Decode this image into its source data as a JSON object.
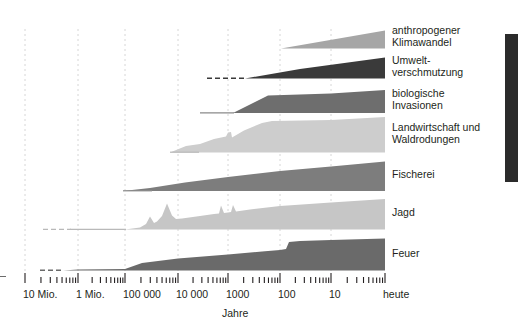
{
  "figure": {
    "axis_title": "Jahre",
    "axis_scale": "logarithmic-reversed",
    "left_edge_mark": "axis-start-mark"
  },
  "series_labels": [
    "anthropogener\nKlimawandel",
    "Umwelt-\nverschmutzung",
    "biologische\nInvasionen",
    "Landwirtschaft und\nWaldrodungen",
    "Fischerei",
    "Jagd",
    "Feuer"
  ],
  "axis": {
    "ticks": [
      "10 Mio.",
      "1 Mio.",
      "100 000",
      "10 000",
      "1000",
      "100",
      "10",
      "heute"
    ],
    "tick_x": [
      25,
      78,
      125,
      178,
      228,
      280,
      331,
      385
    ]
  },
  "colors": {
    "klimawandel": "#a6a6a6",
    "umweltverschmutzung": "#3a3a3a",
    "invasionen": "#6e6e6e",
    "landwirtschaft": "#cdcdcd",
    "fischerei": "#7d7d7d",
    "jagd": "#c6c6c6",
    "feuer": "#6a6a6a",
    "gridline": "#d6d6d6",
    "text": "#231f20",
    "right_bar": "#2b2b2b"
  },
  "chart_data": {
    "type": "area",
    "title": "",
    "xlabel": "Jahre",
    "ylabel": "",
    "grid": true,
    "legend_position": "right-inline",
    "x_axis": {
      "scale": "log-reversed",
      "tick_labels": [
        "10 Mio.",
        "1 Mio.",
        "100 000",
        "10 000",
        "1000",
        "100",
        "10",
        "heute"
      ],
      "tick_values": [
        10000000,
        1000000,
        100000,
        10000,
        1000,
        100,
        10,
        0
      ],
      "units": "Jahre vor heute"
    },
    "series": [
      {
        "name": "anthropogener Klimawandel",
        "color": "#a6a6a6",
        "starts_at_years_ago": 100,
        "dashed_prefix": false,
        "values": [
          {
            "x": 100,
            "intensity": 0
          },
          {
            "x": 10,
            "intensity": 0.55
          },
          {
            "x": 0,
            "intensity": 1.0
          }
        ]
      },
      {
        "name": "Umweltverschmutzung",
        "color": "#3a3a3a",
        "starts_at_years_ago": 2500,
        "dashed_prefix": true,
        "values": [
          {
            "x": 2500,
            "intensity": 0
          },
          {
            "x": 600,
            "intensity": 0.05
          },
          {
            "x": 100,
            "intensity": 0.5
          },
          {
            "x": 0,
            "intensity": 1.0
          }
        ]
      },
      {
        "name": "biologische Invasionen",
        "color": "#6e6e6e",
        "starts_at_years_ago": 3500,
        "dashed_prefix": false,
        "values": [
          {
            "x": 3500,
            "intensity": 0
          },
          {
            "x": 1000,
            "intensity": 0.05
          },
          {
            "x": 300,
            "intensity": 0.78
          },
          {
            "x": 100,
            "intensity": 0.85
          },
          {
            "x": 0,
            "intensity": 1.0
          }
        ]
      },
      {
        "name": "Landwirtschaft und Waldrodungen",
        "color": "#cdcdcd",
        "starts_at_years_ago": 12000,
        "dashed_prefix": false,
        "values": [
          {
            "x": 12000,
            "intensity": 0
          },
          {
            "x": 6000,
            "intensity": 0.22
          },
          {
            "x": 3000,
            "intensity": 0.42
          },
          {
            "x": 1800,
            "intensity": 0.52
          },
          {
            "x": 1500,
            "intensity": 0.4
          },
          {
            "x": 600,
            "intensity": 0.9
          },
          {
            "x": 100,
            "intensity": 0.95
          },
          {
            "x": 0,
            "intensity": 1.0
          }
        ]
      },
      {
        "name": "Fischerei",
        "color": "#7d7d7d",
        "starts_at_years_ago": 1000000,
        "dashed_prefix": false,
        "values": [
          {
            "x": 1000000,
            "intensity": 0
          },
          {
            "x": 30000,
            "intensity": 0.12
          },
          {
            "x": 1000,
            "intensity": 0.45
          },
          {
            "x": 0,
            "intensity": 1.0
          }
        ]
      },
      {
        "name": "Jagd",
        "color": "#c6c6c6",
        "starts_at_years_ago": 20000000,
        "dashed_prefix": true,
        "values": [
          {
            "x": 20000000,
            "intensity": 0
          },
          {
            "x": 1000000,
            "intensity": 0
          },
          {
            "x": 60000,
            "intensity": 0.04
          },
          {
            "x": 40000,
            "intensity": 0.42
          },
          {
            "x": 30000,
            "intensity": 0.25
          },
          {
            "x": 14000,
            "intensity": 0.92
          },
          {
            "x": 9000,
            "intensity": 0.4
          },
          {
            "x": 2000,
            "intensity": 0.62
          },
          {
            "x": 1600,
            "intensity": 0.45
          },
          {
            "x": 900,
            "intensity": 0.66
          },
          {
            "x": 700,
            "intensity": 0.5
          },
          {
            "x": 100,
            "intensity": 0.7
          },
          {
            "x": 0,
            "intensity": 0.82
          }
        ]
      },
      {
        "name": "Feuer",
        "color": "#6a6a6a",
        "starts_at_years_ago": 10000000,
        "dashed_prefix": true,
        "values": [
          {
            "x": 10000000,
            "intensity": 0
          },
          {
            "x": 1000000,
            "intensity": 0.04
          },
          {
            "x": 100000,
            "intensity": 0.06
          },
          {
            "x": 20000,
            "intensity": 0.35
          },
          {
            "x": 3000,
            "intensity": 0.48
          },
          {
            "x": 500,
            "intensity": 0.6
          },
          {
            "x": 200,
            "intensity": 0.64
          },
          {
            "x": 120,
            "intensity": 0.95
          },
          {
            "x": 0,
            "intensity": 1.0
          }
        ]
      }
    ]
  }
}
